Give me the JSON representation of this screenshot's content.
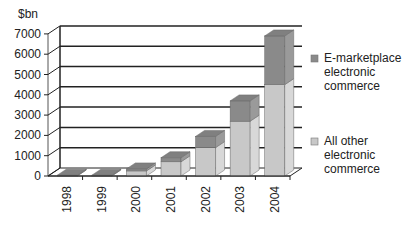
{
  "chart_data": {
    "type": "bar",
    "stacked": true,
    "three_d": true,
    "title": "",
    "ylabel": "$bn",
    "xlabel": "",
    "ylim": [
      0,
      7000
    ],
    "yticks": [
      0,
      1000,
      2000,
      3000,
      4000,
      5000,
      6000,
      7000
    ],
    "grid": true,
    "legend_position": "right",
    "categories": [
      "1998",
      "1999",
      "2000",
      "2001",
      "2002",
      "2003",
      "2004"
    ],
    "series": [
      {
        "name": "All other electronic commerce",
        "color": "#c8c8c8",
        "values": [
          10,
          10,
          250,
          700,
          1400,
          2700,
          4500
        ]
      },
      {
        "name": "E-marketplace electronic commerce",
        "color": "#8a8a8a",
        "values": [
          30,
          30,
          100,
          200,
          550,
          1000,
          2400
        ]
      }
    ]
  },
  "legend": [
    {
      "lines": [
        "E-marketplace",
        "electronic",
        "commerce"
      ],
      "color": "#8a8a8a"
    },
    {
      "lines": [
        "All other",
        "electronic",
        "commerce"
      ],
      "color": "#c8c8c8"
    }
  ]
}
